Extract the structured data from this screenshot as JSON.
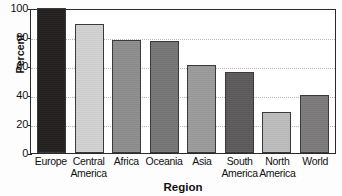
{
  "chart_data": {
    "type": "bar",
    "title": "",
    "xlabel": "Region",
    "ylabel": "Percent",
    "categories": [
      "Europe",
      "Central America",
      "Africa",
      "Oceania",
      "Asia",
      "South America",
      "North America",
      "World"
    ],
    "values": [
      100,
      89,
      78,
      77,
      61,
      56,
      28,
      40
    ],
    "ylim": [
      0,
      100
    ],
    "yticks": [
      0,
      20,
      40,
      60,
      80,
      100
    ],
    "ytick_labels": [
      "0",
      "20",
      "40",
      "60",
      "80",
      "100"
    ],
    "grid": true,
    "grid_axis": "y",
    "legend": false,
    "bar_colors": [
      "#231f1e",
      "#d2d2d2",
      "#8d8d8d",
      "#767676",
      "#9b9b9b",
      "#5c5a5a",
      "#bdbdbd",
      "#7c7a7a"
    ],
    "bar_edge_color": "#3a3a3a",
    "axis_color": "#2a2a2a",
    "gridline_color": "#b9b9b9",
    "background_color": "#ffffff"
  }
}
